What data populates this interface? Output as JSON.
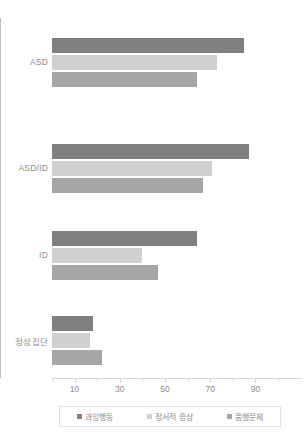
{
  "chart_data": {
    "type": "bar",
    "orientation": "horizontal",
    "title": "",
    "xlabel": "",
    "ylabel": "",
    "categories": [
      "ASD",
      "ASD/ID",
      "ID",
      "정상집단"
    ],
    "series": [
      {
        "name": "과잉행동",
        "color": "#808080",
        "values": [
          85,
          87,
          64,
          18
        ]
      },
      {
        "name": "정서적 증상",
        "color": "#d0d0d0",
        "values": [
          73,
          71,
          40,
          17
        ]
      },
      {
        "name": "품행문제",
        "color": "#a6a6a6",
        "values": [
          64,
          67,
          47,
          22
        ]
      }
    ],
    "xlim": [
      0,
      100
    ],
    "xticks": [
      10,
      30,
      50,
      70,
      90
    ],
    "xtick_labels": [
      "10",
      "30",
      "50",
      "70",
      "90"
    ],
    "minor_ticks": [
      0,
      20,
      40,
      60,
      80,
      100
    ],
    "grid": false,
    "legend_position": "bottom"
  },
  "legend": {
    "items": [
      {
        "label": "과잉행동",
        "marker": "square-swatch"
      },
      {
        "label": "정서적 증상",
        "marker": "square-swatch"
      },
      {
        "label": "품행문제",
        "marker": "square-swatch"
      }
    ]
  }
}
